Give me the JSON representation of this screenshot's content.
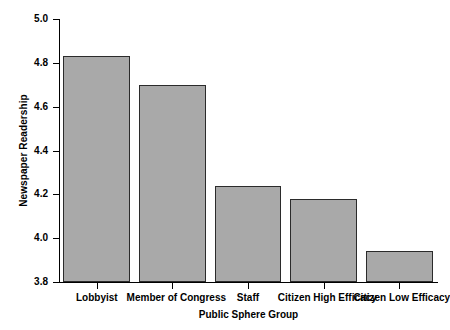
{
  "chart_data": {
    "type": "bar",
    "title": "",
    "xlabel": "Public Sphere Group",
    "ylabel": "Newspaper Readership",
    "categories": [
      "Lobbyist",
      "Member of Congress",
      "Staff",
      "Citizen High Efficacy",
      "Citizen Low Efficacy"
    ],
    "values": [
      4.83,
      4.7,
      4.24,
      4.18,
      3.94
    ],
    "ylim": [
      3.8,
      5.0
    ],
    "yticks": [
      "5.0",
      "4.8",
      "4.6",
      "4.4",
      "4.2",
      "4.0",
      "3.8"
    ],
    "ytick_values": [
      5.0,
      4.8,
      4.6,
      4.4,
      4.2,
      4.0,
      3.8
    ],
    "grid": false,
    "legend": null,
    "bar_color": "#a9a9a9",
    "bar_edge_color": "#2b2b2b",
    "background_color": "#ffffff"
  }
}
